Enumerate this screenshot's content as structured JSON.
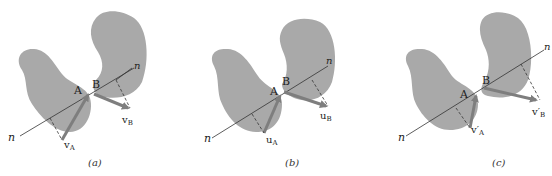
{
  "figure": {
    "panels": [
      {
        "caption": "(a)",
        "point_a": "A",
        "point_b": "B",
        "normal_label_lower": "n",
        "normal_label_upper": "n",
        "vec_a": "v",
        "vec_a_sub": "A",
        "vec_b": "v",
        "vec_b_sub": "B"
      },
      {
        "caption": "(b)",
        "point_a": "A",
        "point_b": "B",
        "normal_label_lower": "n",
        "normal_label_upper": "n",
        "vec_a": "u",
        "vec_a_sub": "A",
        "vec_b": "u",
        "vec_b_sub": "B"
      },
      {
        "caption": "(c)",
        "point_a": "A",
        "point_b": "B",
        "normal_label_lower": "n",
        "normal_label_upper": "n",
        "vec_a": "v′",
        "vec_a_sub": "A",
        "vec_b": "v′",
        "vec_b_sub": "B"
      }
    ],
    "colors": {
      "body_fill": "#a9a9a9",
      "arrow": "#7e7e7e",
      "line": "#333333"
    }
  }
}
